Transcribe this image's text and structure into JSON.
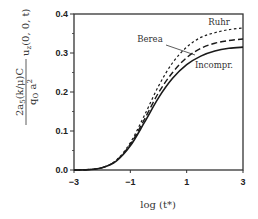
{
  "chart_data": {
    "type": "line",
    "title": "",
    "xlabel": "log (t*)",
    "ylabel": "2a_s(k/μ)C / (q_o a^2) · u_z(0, 0, t)",
    "ylabel_parts": {
      "numerator": "2a",
      "numerator_sub": "5",
      "numerator_rest": "(k/μ)C",
      "denominator": "q",
      "denominator_sub": "O",
      "denominator_rest": " a",
      "denominator_sup": "2",
      "suffix": "u",
      "suffix_sub": "z",
      "suffix_rest": "(0, 0, t)"
    },
    "xlim": [
      -3,
      3
    ],
    "ylim": [
      0.0,
      0.4
    ],
    "x_ticks": [
      -3,
      -1,
      1,
      3
    ],
    "x_tick_labels": [
      "−3",
      "−1",
      "1",
      "3"
    ],
    "y_ticks": [
      0.0,
      0.1,
      0.2,
      0.3,
      0.4
    ],
    "y_tick_labels": [
      "0.0",
      "0.1",
      "0.2",
      "0.3",
      "0.4"
    ],
    "grid": false,
    "legend": "inline annotations",
    "x": [
      -3,
      -2.5,
      -2,
      -1.5,
      -1,
      -0.5,
      0,
      0.5,
      1,
      1.5,
      2,
      2.5,
      3
    ],
    "series": [
      {
        "name": "Ruhr",
        "style": "dotted",
        "values": [
          0.0,
          0.001,
          0.006,
          0.025,
          0.07,
          0.14,
          0.215,
          0.275,
          0.315,
          0.34,
          0.352,
          0.36,
          0.364
        ]
      },
      {
        "name": "Berea",
        "style": "dashed",
        "values": [
          0.0,
          0.001,
          0.006,
          0.024,
          0.066,
          0.13,
          0.198,
          0.25,
          0.288,
          0.312,
          0.325,
          0.332,
          0.336
        ]
      },
      {
        "name": "Incompr.",
        "style": "solid",
        "values": [
          0.0,
          0.001,
          0.006,
          0.023,
          0.062,
          0.122,
          0.185,
          0.235,
          0.27,
          0.292,
          0.305,
          0.312,
          0.315
        ]
      }
    ],
    "annotations": [
      {
        "text": "Ruhr",
        "target": "Ruhr"
      },
      {
        "text": "Berea",
        "target": "Berea"
      },
      {
        "text": "Incompr.",
        "target": "Incompr."
      }
    ]
  }
}
